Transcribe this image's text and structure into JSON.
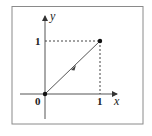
{
  "diagram": {
    "type": "coordinate-plot",
    "axes": {
      "x_label": "x",
      "y_label": "y"
    },
    "ticks": {
      "origin": "0",
      "x_one": "1",
      "y_one": "1"
    },
    "points": [
      {
        "name": "origin",
        "x": 0,
        "y": 0
      },
      {
        "name": "unit-point",
        "x": 1,
        "y": 1
      }
    ],
    "segment": {
      "from": [
        0,
        0
      ],
      "to": [
        1,
        1
      ],
      "direction_arrow": "midpoint"
    },
    "guides": [
      "dashed horizontal from y=1 to point (1,1)",
      "dashed vertical from x=1 to point (1,1)"
    ],
    "colors": {
      "border": "#8a8a8a",
      "axis": "#555555",
      "line": "#444444",
      "point": "#111111"
    }
  }
}
